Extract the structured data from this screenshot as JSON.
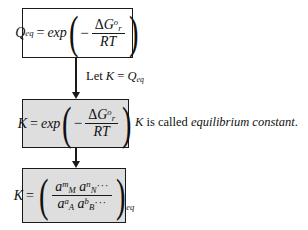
{
  "diagram": {
    "type": "flowchart",
    "colors": {
      "stroke": "#1a1a1a",
      "box_fill_white": "#ffffff",
      "box_fill_gray": "#dedede",
      "page_background": "#ffffff",
      "text": "#111111"
    },
    "nodes": [
      {
        "id": "box-q",
        "name": "equation-box-q-eq",
        "fill": "white",
        "equation_plain": "Q_eq = exp(-ΔG°_r / RT)",
        "parts": {
          "lhs_var": "Q",
          "lhs_sub": "eq",
          "equals": "=",
          "function": "exp",
          "sign": "−",
          "numer_delta": "Δ",
          "numer_var": "G",
          "numer_sup": "o",
          "numer_sub": "r",
          "denom": "RT"
        }
      },
      {
        "id": "box-k",
        "name": "equation-box-k-exp",
        "fill": "gray",
        "equation_plain": "K = exp(-ΔG°_r / RT)",
        "parts": {
          "lhs_var": "K",
          "equals": "=",
          "function": "exp",
          "sign": "−",
          "numer_delta": "Δ",
          "numer_var": "G",
          "numer_sup": "o",
          "numer_sub": "r",
          "denom": "RT"
        }
      },
      {
        "id": "box-ka",
        "name": "equation-box-k-activities",
        "fill": "gray",
        "equation_plain": "K = ( a_M^m a_N^n ··· / a_A^a a_B^b ··· )_eq",
        "parts": {
          "lhs_var": "K",
          "equals": "=",
          "num_a1_base": "a",
          "num_a1_sub": "M",
          "num_a1_sup": "m",
          "num_a2_base": "a",
          "num_a2_sub": "N",
          "num_a2_sup": "n",
          "num_dots": "···",
          "den_a1_base": "a",
          "den_a1_sub": "A",
          "den_a1_sup": "a",
          "den_a2_base": "a",
          "den_a2_sub": "B",
          "den_a2_sup": "b",
          "den_dots": "···",
          "outer_sub": "eq"
        }
      }
    ],
    "connectors": [
      {
        "id": "conn-1",
        "name": "arrow-q-to-k",
        "from": "box-q",
        "to": "box-k",
        "style": "down-arrow"
      },
      {
        "id": "conn-2",
        "name": "arrow-k-to-ka",
        "from": "box-k",
        "to": "box-ka",
        "style": "down-arrow"
      }
    ],
    "annotations": {
      "let_label": {
        "name": "annotation-let-k-equals-q-eq",
        "prefix": "Let ",
        "var_k": "K",
        "equals": " = ",
        "var_q": "Q",
        "var_q_sub": "eq"
      },
      "called_label": {
        "name": "annotation-k-is-called",
        "var_k": "K",
        "text_before": " is called ",
        "emphasis": "equilibrium constant",
        "text_after": "."
      }
    }
  }
}
